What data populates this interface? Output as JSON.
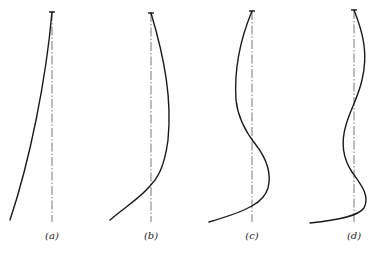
{
  "figure": {
    "panels": [
      {
        "label": "(a)",
        "mode": 1,
        "axis_x": 52,
        "top_y": 12,
        "bottom_y": 222
      },
      {
        "label": "(b)",
        "mode": 2,
        "axis_x": 151,
        "top_y": 13,
        "bottom_y": 222
      },
      {
        "label": "(c)",
        "mode": 3,
        "axis_x": 252,
        "top_y": 11,
        "bottom_y": 222
      },
      {
        "label": "(d)",
        "mode": 4,
        "axis_x": 354,
        "top_y": 10,
        "bottom_y": 222
      }
    ],
    "colors": {
      "line": "#1a1a1a",
      "axis": "#555555",
      "background": "#ffffff"
    }
  }
}
